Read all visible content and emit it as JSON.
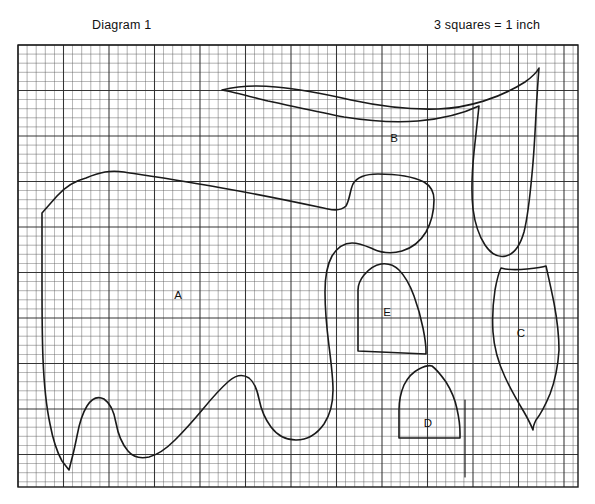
{
  "page": {
    "background_color": "#ffffff",
    "width": 595,
    "height": 504
  },
  "header": {
    "diagram_title": "Diagram 1",
    "scale_note": "3 squares  =  1 inch"
  },
  "grid": {
    "label": "graph-paper-grid",
    "x": 18,
    "y": 45,
    "width": 560,
    "height": 442,
    "cell_size": 9.1,
    "minor_line_color": "#5a5a5a",
    "major_line_color": "#2b2b2b",
    "major_every": 5,
    "border_color": "#1a1a1a"
  },
  "regions": [
    {
      "id": "A",
      "label": "A",
      "label_x": 178,
      "label_y": 296
    },
    {
      "id": "B",
      "label": "B",
      "label_x": 394,
      "label_y": 139
    },
    {
      "id": "C",
      "label": "C",
      "label_x": 521,
      "label_y": 334
    },
    {
      "id": "D",
      "label": "D",
      "label_x": 428,
      "label_y": 424
    },
    {
      "id": "E",
      "label": "E",
      "label_x": 387,
      "label_y": 313
    }
  ],
  "shapes": {
    "outline_color": "#1a1a1a",
    "outline_width": 1.6,
    "region_a_path": "M 42 213 L 57 196 C 66 186 74 181 86 178 C 100 172 110 170 124 172 C 150 176 185 181 222 188 C 268 196 300 203 328 209 C 337 211 342 210 346 206 C 350 199 350 190 353 184 C 357 177 366 174 378 174 C 396 174 414 177 424 182 C 431 186 434 192 434 200 C 434 212 431 223 426 232 C 420 242 412 248 402 251 C 392 254 382 253 373 249 C 366 246 360 243 352 243 C 343 243 337 248 332 256 C 327 265 325 277 325 292 C 325 312 327 330 329 346 C 331 362 333 377 333 390 C 333 404 330 415 324 424 C 317 434 307 440 296 440 C 285 440 277 435 271 427 C 265 419 261 409 259 399 C 257 389 254 382 249 378 C 243 374 236 375 229 381 C 221 388 212 398 203 409 C 193 421 184 431 175 440 C 166 449 157 455 149 457 C 140 459 133 457 128 451 C 122 444 118 434 116 423 C 114 411 110 403 104 399 C 98 396 92 398 87 406 C 82 414 79 425 77 436 C 75 446 73 455 71 462 L 69 470 L 62 461 C 57 452 53 440 50 424 C 46 405 44 383 43 359 C 42 334 42 308 42 283 C 42 258 42 236 42 224 Z",
    "region_b_path": "M 222 90 C 238 86 256 85 276 87 C 300 89 325 94 351 100 C 379 106 408 110 438 109 C 468 108 500 98 525 82 C 532 77 537 72 539 68 C 538 80 537 96 536 114 C 535 134 534 154 532 174 C 530 196 528 216 524 232 C 520 246 514 254 506 256 C 498 258 491 254 485 245 C 479 236 475 224 473 209 C 471 192 472 172 474 152 C 476 133 478 116 479 106 C 462 114 441 119 418 121 C 394 123 369 121 344 117 C 318 112 292 106 268 101 C 248 96 233 92 222 90 Z",
    "region_c_path": "M 501 268 C 508 270 517 270 527 269 C 536 268 543 267 546 266 C 548 275 551 288 554 303 C 557 319 559 335 559 350 C 558 366 555 381 550 394 C 545 406 540 415 536 420 C 534 424 533 427 533 430 C 531 425 528 419 524 412 C 518 402 511 390 505 377 C 498 362 494 347 493 332 C 492 317 493 303 495 290 C 497 279 499 272 501 268 Z",
    "region_d_path": "M 399 438 L 399 410 C 399 400 401 392 404 385 C 408 377 413 372 419 369 C 425 366 429 365 432 366 C 436 369 441 375 446 382 C 451 390 455 399 457 409 C 459 418 460 427 460 433 L 460 438 Z",
    "region_e_path": "M 358 351 L 358 290 C 358 285 360 280 364 275 C 369 269 375 265 381 264 C 388 263 394 265 399 270 C 405 276 410 285 414 296 C 418 307 421 318 423 328 C 425 338 426 346 426 351 L 426 354 Z",
    "tick_mark_path": "M 465 400 L 465 477"
  }
}
